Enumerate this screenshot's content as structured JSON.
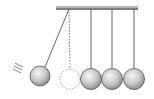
{
  "diagram": {
    "frame": {
      "x1": 56,
      "x2": 138,
      "y": 8,
      "color": "#555555"
    },
    "balls": [
      {
        "id": "swinging",
        "cx": 40,
        "cy": 76,
        "r": 10,
        "pivot_x": 69,
        "state": "raised"
      },
      {
        "id": "ghost",
        "cx": 70,
        "cy": 79,
        "r": 10,
        "pivot_x": 69,
        "state": "rest-position-dashed"
      },
      {
        "id": "ball-2",
        "cx": 91,
        "cy": 79,
        "r": 10,
        "pivot_x": 91,
        "state": "rest"
      },
      {
        "id": "ball-3",
        "cx": 112,
        "cy": 79,
        "r": 10,
        "pivot_x": 112,
        "state": "rest"
      },
      {
        "id": "ball-4",
        "cx": 134,
        "cy": 79,
        "r": 10,
        "pivot_x": 134,
        "state": "rest"
      }
    ],
    "colors": {
      "ball_light": "#f4f4f4",
      "ball_dark": "#8a8a8a",
      "outline": "#555555",
      "string": "#666666"
    },
    "motion_marks": 3
  }
}
